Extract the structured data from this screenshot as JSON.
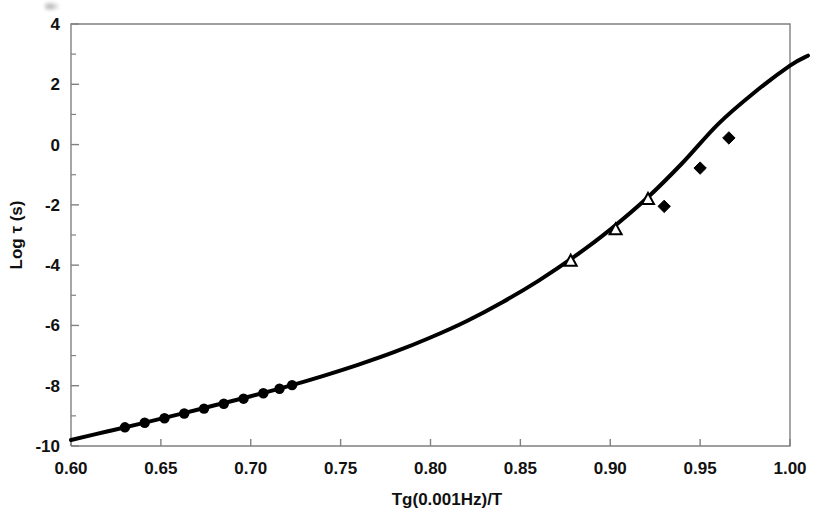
{
  "chart_data": {
    "type": "scatter",
    "title": "",
    "xlabel": "Tg(0.001Hz)/T",
    "ylabel": "Log τ (s)",
    "xlim": [
      0.6,
      1.0
    ],
    "ylim": [
      -10,
      4
    ],
    "xticks": [
      0.6,
      0.65,
      0.7,
      0.75,
      0.8,
      0.85,
      0.9,
      0.95,
      1.0
    ],
    "xtick_labels": [
      "0.60",
      "0.65",
      "0.70",
      "0.75",
      "0.80",
      "0.85",
      "0.90",
      "0.95",
      "1.00"
    ],
    "yticks": [
      -10,
      -8,
      -6,
      -4,
      -2,
      0,
      2,
      4
    ],
    "ytick_labels": [
      "-10",
      "-8",
      "-6",
      "-4",
      "-2",
      "0",
      "2",
      "4"
    ],
    "yminor_ticks": [
      -9,
      -7,
      -5,
      -3,
      -1,
      1,
      3
    ],
    "grid": false,
    "legend": null,
    "series": [
      {
        "name": "fit-curve",
        "marker": "none",
        "line": "solid",
        "color": "#000000",
        "linewidth": 4,
        "x": [
          0.6,
          0.62,
          0.64,
          0.66,
          0.68,
          0.7,
          0.72,
          0.74,
          0.76,
          0.78,
          0.8,
          0.82,
          0.84,
          0.86,
          0.88,
          0.9,
          0.92,
          0.94,
          0.96,
          0.98,
          1.0,
          1.01
        ],
        "y": [
          -9.8,
          -9.52,
          -9.24,
          -8.95,
          -8.65,
          -8.35,
          -8.03,
          -7.68,
          -7.3,
          -6.88,
          -6.4,
          -5.86,
          -5.23,
          -4.52,
          -3.72,
          -2.82,
          -1.8,
          -0.62,
          0.68,
          1.72,
          2.62,
          2.95
        ]
      },
      {
        "name": "filled-circles",
        "marker": "circle-filled",
        "color": "#000000",
        "x": [
          0.63,
          0.641,
          0.652,
          0.663,
          0.674,
          0.685,
          0.696,
          0.707,
          0.716,
          0.723
        ],
        "y": [
          -9.38,
          -9.23,
          -9.08,
          -8.92,
          -8.76,
          -8.6,
          -8.43,
          -8.25,
          -8.1,
          -7.98
        ]
      },
      {
        "name": "open-triangles",
        "marker": "triangle-open",
        "color": "#000000",
        "x": [
          0.878,
          0.903,
          0.921
        ],
        "y": [
          -3.88,
          -2.84,
          -1.83
        ]
      },
      {
        "name": "filled-diamonds",
        "marker": "diamond-filled",
        "color": "#000000",
        "x": [
          0.93,
          0.95,
          0.966
        ],
        "y": [
          -2.05,
          -0.78,
          0.22
        ]
      }
    ]
  },
  "figure": {
    "background": "#ffffff",
    "axis_color": "#808080",
    "text_color": "#111111"
  }
}
